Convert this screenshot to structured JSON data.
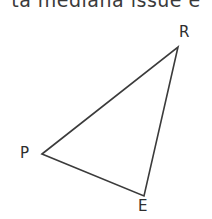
{
  "header": {
    "text": "ta mediana issue e"
  },
  "figure": {
    "name": "triangle-PRE",
    "type": "triangle",
    "stroke_color": "#3b3b3b",
    "stroke_width": 1.6,
    "fill": "none",
    "background_color": "#ffffff",
    "vertices": [
      {
        "id": "P",
        "label": "P",
        "x": 42,
        "y": 154,
        "label_x": 20,
        "label_y": 146
      },
      {
        "id": "R",
        "label": "R",
        "x": 178,
        "y": 47,
        "label_x": 179,
        "label_y": 25
      },
      {
        "id": "E",
        "label": "E",
        "x": 144,
        "y": 196,
        "label_x": 138,
        "label_y": 199
      }
    ],
    "edges": [
      {
        "id": "PR",
        "from": "P",
        "to": "R"
      },
      {
        "id": "RE",
        "from": "R",
        "to": "E"
      },
      {
        "id": "EP",
        "from": "E",
        "to": "P"
      }
    ],
    "path": "M 42 154 L 178 47 L 144 196 Z"
  },
  "canvas": {
    "width": 212,
    "height": 219
  }
}
